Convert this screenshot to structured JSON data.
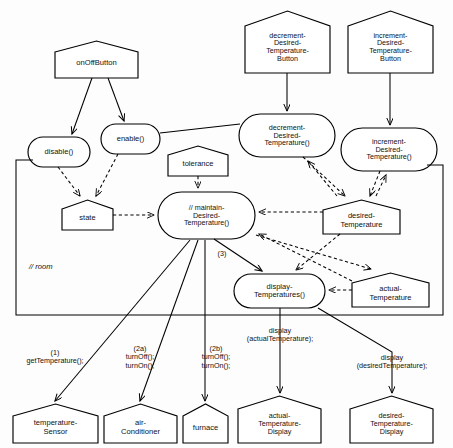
{
  "diagram": {
    "container_label": "// room",
    "stroke_color": "#000000",
    "fill_color": "#ffffff"
  },
  "external_entities": [
    {
      "id": "onOffButton",
      "label": "onOffButton",
      "lines": [
        "onOffButton"
      ],
      "x": 55,
      "y": 41,
      "w": 83,
      "h": 37,
      "notch": 11
    },
    {
      "id": "decrementDesiredTemperatureButton",
      "label": "decrement-Desired-Temperature-Button",
      "lines": [
        "decrement-",
        "Desired-",
        "Temperature-",
        "Button"
      ],
      "x": 245,
      "y": 11,
      "w": 85,
      "h": 62,
      "notch": 15
    },
    {
      "id": "incrementDesiredTemperatureButton",
      "label": "increment-Desired-Temperature-Button",
      "lines": [
        "increment-",
        "Desired-",
        "Temperature-",
        "Button"
      ],
      "x": 348,
      "y": 11,
      "w": 85,
      "h": 62,
      "notch": 15
    },
    {
      "id": "temperatureSensor",
      "label": "temperature-Sensor",
      "lines": [
        "temperature-",
        "Sensor"
      ],
      "x": 13,
      "y": 404,
      "w": 85,
      "h": 39,
      "notch": 12
    },
    {
      "id": "airConditioner",
      "label": "air-Conditioner",
      "lines": [
        "air-",
        "Conditioner"
      ],
      "x": 104,
      "y": 404,
      "w": 73,
      "h": 39,
      "notch": 12
    },
    {
      "id": "furnace",
      "label": "furnace",
      "lines": [
        "furnace"
      ],
      "x": 183,
      "y": 404,
      "w": 45,
      "h": 39,
      "notch": 12
    },
    {
      "id": "actualTemperatureDisplay",
      "label": "actual-Temperature-Display",
      "lines": [
        "actual-",
        "Temperature-",
        "Display"
      ],
      "x": 238,
      "y": 396,
      "w": 83,
      "h": 47,
      "notch": 13
    },
    {
      "id": "desiredTemperatureDisplay",
      "label": "desired-Temperature-Display",
      "lines": [
        "desired-",
        "Temperature-",
        "Display"
      ],
      "x": 350,
      "y": 396,
      "w": 83,
      "h": 47,
      "notch": 13
    }
  ],
  "attributes": [
    {
      "id": "tolerance",
      "label": "tolerance",
      "lines": [
        "tolerance"
      ],
      "x": 168,
      "y": 146,
      "w": 60,
      "h": 30,
      "notch": 9
    },
    {
      "id": "state",
      "label": "state",
      "lines": [
        "state"
      ],
      "x": 62,
      "y": 200,
      "w": 51,
      "h": 30,
      "notch": 9
    },
    {
      "id": "desiredTemperature",
      "label": "desired-Temperature",
      "lines": [
        "desired-",
        "Temperature"
      ],
      "x": 323,
      "y": 200,
      "w": 77,
      "h": 34,
      "notch": 10
    },
    {
      "id": "actualTemperature",
      "label": "actual-Temperature",
      "lines": [
        "actual-",
        "Temperature"
      ],
      "x": 352,
      "y": 273,
      "w": 77,
      "h": 34,
      "notch": 10
    }
  ],
  "operations": [
    {
      "id": "disable",
      "label": "disable()",
      "lines": [
        "disable()"
      ],
      "x": 28,
      "y": 137,
      "w": 62,
      "h": 30
    },
    {
      "id": "enable",
      "label": "enable()",
      "lines": [
        "enable()"
      ],
      "x": 101,
      "y": 124,
      "w": 59,
      "h": 30
    },
    {
      "id": "decrementDesiredTemperature",
      "label": "decrement-Desired-Temperature()",
      "lines": [
        "decrement-",
        "Desired-",
        "Temperature()"
      ],
      "x": 239,
      "y": 114,
      "w": 96,
      "h": 43
    },
    {
      "id": "incrementDesiredTemperature",
      "label": "increment-Desired-Temperature()",
      "lines": [
        "increment-",
        "Desired-",
        "Temperature()"
      ],
      "x": 341,
      "y": 128,
      "w": 96,
      "h": 43
    },
    {
      "id": "maintainDesiredTemperature",
      "label": "// maintain-Desired-Temperature()",
      "lines": [
        "// maintain-",
        "Desired-",
        "Temperature()"
      ],
      "x": 158,
      "y": 192,
      "w": 97,
      "h": 47
    },
    {
      "id": "displayTemperatures",
      "label": "display-Temperatures()",
      "lines": [
        "display-",
        "Temperatures()"
      ],
      "x": 234,
      "y": 274,
      "w": 91,
      "h": 34
    }
  ],
  "room_container": {
    "x": 16,
    "y": 160,
    "w": 427,
    "h": 155,
    "label": "// room",
    "label_x": 29,
    "label_y": 262
  },
  "edge_labels": [
    {
      "id": "seq3",
      "lines": [
        "(3)"
      ],
      "x": 212,
      "y": 250,
      "w": 20
    },
    {
      "id": "call1",
      "lines": [
        "(1)",
        "getTemperature();"
      ],
      "x": 10,
      "y": 349,
      "w": 90
    },
    {
      "id": "call2a",
      "lines": [
        "(2a)",
        "turnOff();",
        "turnOn();"
      ],
      "x": 104,
      "y": 345,
      "w": 72
    },
    {
      "id": "call2b",
      "lines": [
        "(2b)",
        "turnOff();",
        "turnOn();"
      ],
      "x": 180,
      "y": 345,
      "w": 72
    },
    {
      "id": "displayActual",
      "lines": [
        "display",
        "(actualTemperature);"
      ],
      "x": 228,
      "y": 327,
      "w": 104
    },
    {
      "id": "displayDesired",
      "lines": [
        "display",
        "(desiredTemperature);"
      ],
      "x": 338,
      "y": 354,
      "w": 108
    }
  ],
  "relationships": [
    {
      "from": "onOffButton",
      "to": "disable",
      "type": "solid-arrow"
    },
    {
      "from": "onOffButton",
      "to": "enable",
      "type": "solid-arrow"
    },
    {
      "from": "disable",
      "to": "state",
      "type": "dashed-arrow"
    },
    {
      "from": "enable",
      "to": "state",
      "type": "dashed-arrow"
    },
    {
      "from": "enable",
      "to": "decrementDesiredTemperature",
      "type": "solid-line"
    },
    {
      "from": "decrementDesiredTemperatureButton",
      "to": "decrementDesiredTemperature",
      "type": "solid-arrow"
    },
    {
      "from": "incrementDesiredTemperatureButton",
      "to": "incrementDesiredTemperature",
      "type": "solid-arrow"
    },
    {
      "from": "decrementDesiredTemperature",
      "to": "desiredTemperature",
      "type": "dashed-arrow"
    },
    {
      "from": "incrementDesiredTemperature",
      "to": "desiredTemperature",
      "type": "dashed-arrow"
    },
    {
      "from": "desiredTemperature",
      "to": "decrementDesiredTemperature",
      "type": "dashed-arrow"
    },
    {
      "from": "desiredTemperature",
      "to": "incrementDesiredTemperature",
      "type": "dashed-arrow"
    },
    {
      "from": "tolerance",
      "to": "maintainDesiredTemperature",
      "type": "dashed-arrow"
    },
    {
      "from": "state",
      "to": "maintainDesiredTemperature",
      "type": "dashed-arrow"
    },
    {
      "from": "desiredTemperature",
      "to": "maintainDesiredTemperature",
      "type": "dashed-arrow"
    },
    {
      "from": "actualTemperature",
      "to": "maintainDesiredTemperature",
      "type": "dashed-arrow"
    },
    {
      "from": "desiredTemperature",
      "to": "displayTemperatures",
      "type": "dashed-arrow"
    },
    {
      "from": "actualTemperature",
      "to": "displayTemperatures",
      "type": "dashed-arrow"
    },
    {
      "from": "maintainDesiredTemperature",
      "to": "displayTemperatures",
      "type": "solid-arrow"
    },
    {
      "from": "maintainDesiredTemperature",
      "to": "temperatureSensor",
      "type": "solid-arrow"
    },
    {
      "from": "maintainDesiredTemperature",
      "to": "airConditioner",
      "type": "solid-arrow"
    },
    {
      "from": "maintainDesiredTemperature",
      "to": "furnace",
      "type": "solid-arrow"
    },
    {
      "from": "displayTemperatures",
      "to": "actualTemperatureDisplay",
      "type": "solid-arrow"
    },
    {
      "from": "displayTemperatures",
      "to": "desiredTemperatureDisplay",
      "type": "solid-arrow"
    }
  ]
}
